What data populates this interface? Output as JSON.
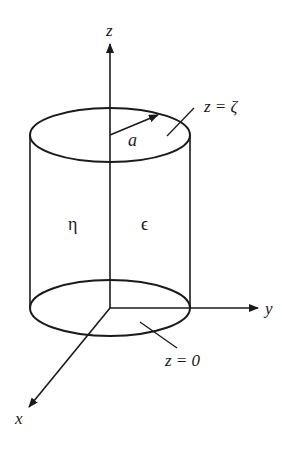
{
  "diagram": {
    "axes": {
      "z": {
        "label": "z"
      },
      "y": {
        "label": "y"
      },
      "x": {
        "label": "x"
      }
    },
    "radius_label": "a",
    "top_surface_label": "z = ζ",
    "bottom_surface_label": "z = 0",
    "region_left_label": "η",
    "region_right_label": "ϵ",
    "colors": {
      "stroke": "#1a1a1a",
      "background": "#ffffff"
    }
  }
}
